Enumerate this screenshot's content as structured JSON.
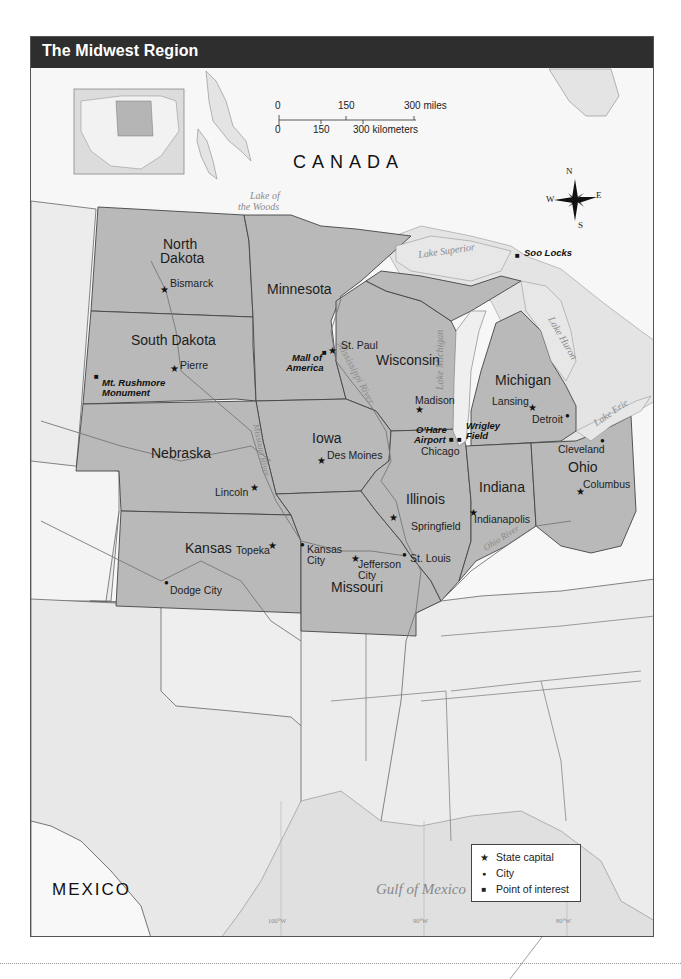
{
  "title": "The Midwest Region",
  "scale_bar": {
    "miles_ticks": [
      "0",
      "150",
      "300 miles"
    ],
    "km_ticks": [
      "0",
      "150",
      "300 kilometers"
    ]
  },
  "compass": {
    "n": "N",
    "s": "S",
    "e": "E",
    "w": "W"
  },
  "countries": {
    "canada": "CANADA",
    "mexico": "MEXICO"
  },
  "water_bodies": {
    "lake_of_the_woods_1": "Lake of",
    "lake_of_the_woods_2": "the Woods",
    "lake_superior": "Lake Superior",
    "lake_michigan": "Lake Michigan",
    "lake_huron": "Lake Huron",
    "lake_erie": "Lake Erie",
    "gulf_of_mexico": "Gulf of Mexico",
    "mississippi_river": "Mississippi River",
    "missouri_river": "Missouri River",
    "ohio_river": "Ohio River"
  },
  "states": {
    "north_dakota_1": "North",
    "north_dakota_2": "Dakota",
    "south_dakota": "South Dakota",
    "minnesota": "Minnesota",
    "wisconsin": "Wisconsin",
    "michigan": "Michigan",
    "iowa": "Iowa",
    "nebraska": "Nebraska",
    "illinois": "Illinois",
    "indiana": "Indiana",
    "ohio": "Ohio",
    "kansas": "Kansas",
    "missouri": "Missouri"
  },
  "capitals": {
    "bismarck": "Bismarck",
    "pierre": "Pierre",
    "st_paul": "St. Paul",
    "madison": "Madison",
    "lansing": "Lansing",
    "des_moines": "Des Moines",
    "lincoln": "Lincoln",
    "springfield": "Springfield",
    "indianapolis": "Indianapolis",
    "columbus": "Columbus",
    "topeka": "Topeka",
    "jefferson_city_1": "Jefferson",
    "jefferson_city_2": "City"
  },
  "cities": {
    "detroit": "Detroit",
    "cleveland": "Cleveland",
    "chicago": "Chicago",
    "kansas_city_1": "Kansas",
    "kansas_city_2": "City",
    "st_louis": "St. Louis",
    "dodge_city": "Dodge City"
  },
  "points_of_interest": {
    "mt_rushmore_1": "Mt. Rushmore",
    "mt_rushmore_2": "Monument",
    "mall_of_america_1": "Mall of",
    "mall_of_america_2": "America",
    "soo_locks": "Soo Locks",
    "ohare_1": "O'Hare",
    "ohare_2": "Airport",
    "wrigley_1": "Wrigley",
    "wrigley_2": "Field"
  },
  "longitudes": [
    "100°W",
    "90°W",
    "80°W"
  ],
  "legend": {
    "items": [
      {
        "symbol": "★",
        "label": "State capital"
      },
      {
        "symbol": "●",
        "label": "City"
      },
      {
        "symbol": "■",
        "label": "Point of interest"
      }
    ]
  },
  "colors": {
    "header_bg": "#2e2e2e",
    "midwest_fill": "#b9b9b9",
    "other_states_fill": "#e9e9e9",
    "water_fill": "#e2e2e2",
    "canada_fill": "#f6f6f6"
  }
}
